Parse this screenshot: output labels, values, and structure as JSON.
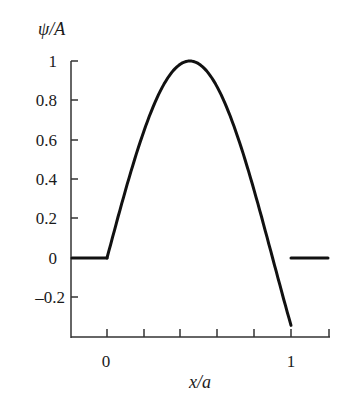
{
  "chart_data": {
    "type": "line",
    "title": "",
    "xlabel": "x/a",
    "ylabel": "ψ/A",
    "x_ticks": [
      0,
      0.2,
      0.4,
      0.6,
      0.8,
      1.0,
      1.2
    ],
    "x_tick_labels": [
      {
        "value": 0,
        "label": "0"
      },
      {
        "value": 1,
        "label": "1"
      }
    ],
    "y_ticks": [
      1,
      0.8,
      0.6,
      0.4,
      0.2,
      0,
      -0.2
    ],
    "y_tick_labels": [
      "1",
      "0.8",
      "0.6",
      "0.4",
      "0.2",
      "0",
      "–0.2"
    ],
    "xlim": [
      -0.2,
      1.2
    ],
    "ylim": [
      -0.43,
      1.02
    ],
    "grid": false,
    "legend": null,
    "series": [
      {
        "name": "left region (x<0)",
        "x": [
          -0.2,
          0
        ],
        "values": [
          0,
          0
        ]
      },
      {
        "name": "inside well",
        "x": [
          0,
          0.1,
          0.2,
          0.3,
          0.45,
          0.6,
          0.7,
          0.8,
          0.9,
          1.0
        ],
        "values": [
          0,
          0.34,
          0.64,
          0.87,
          1.0,
          0.87,
          0.64,
          0.34,
          0.0,
          -0.3
        ]
      },
      {
        "name": "right region (x>1)",
        "x": [
          1.0,
          1.2
        ],
        "values": [
          0,
          0
        ]
      }
    ]
  },
  "labels": {
    "ylabel": "ψ/A",
    "xlabel": "x/a",
    "y1": "1",
    "y08": "0.8",
    "y06": "0.6",
    "y04": "0.4",
    "y02": "0.2",
    "y0": "0",
    "ym02": "–0.2",
    "x0": "0",
    "x1": "1"
  }
}
